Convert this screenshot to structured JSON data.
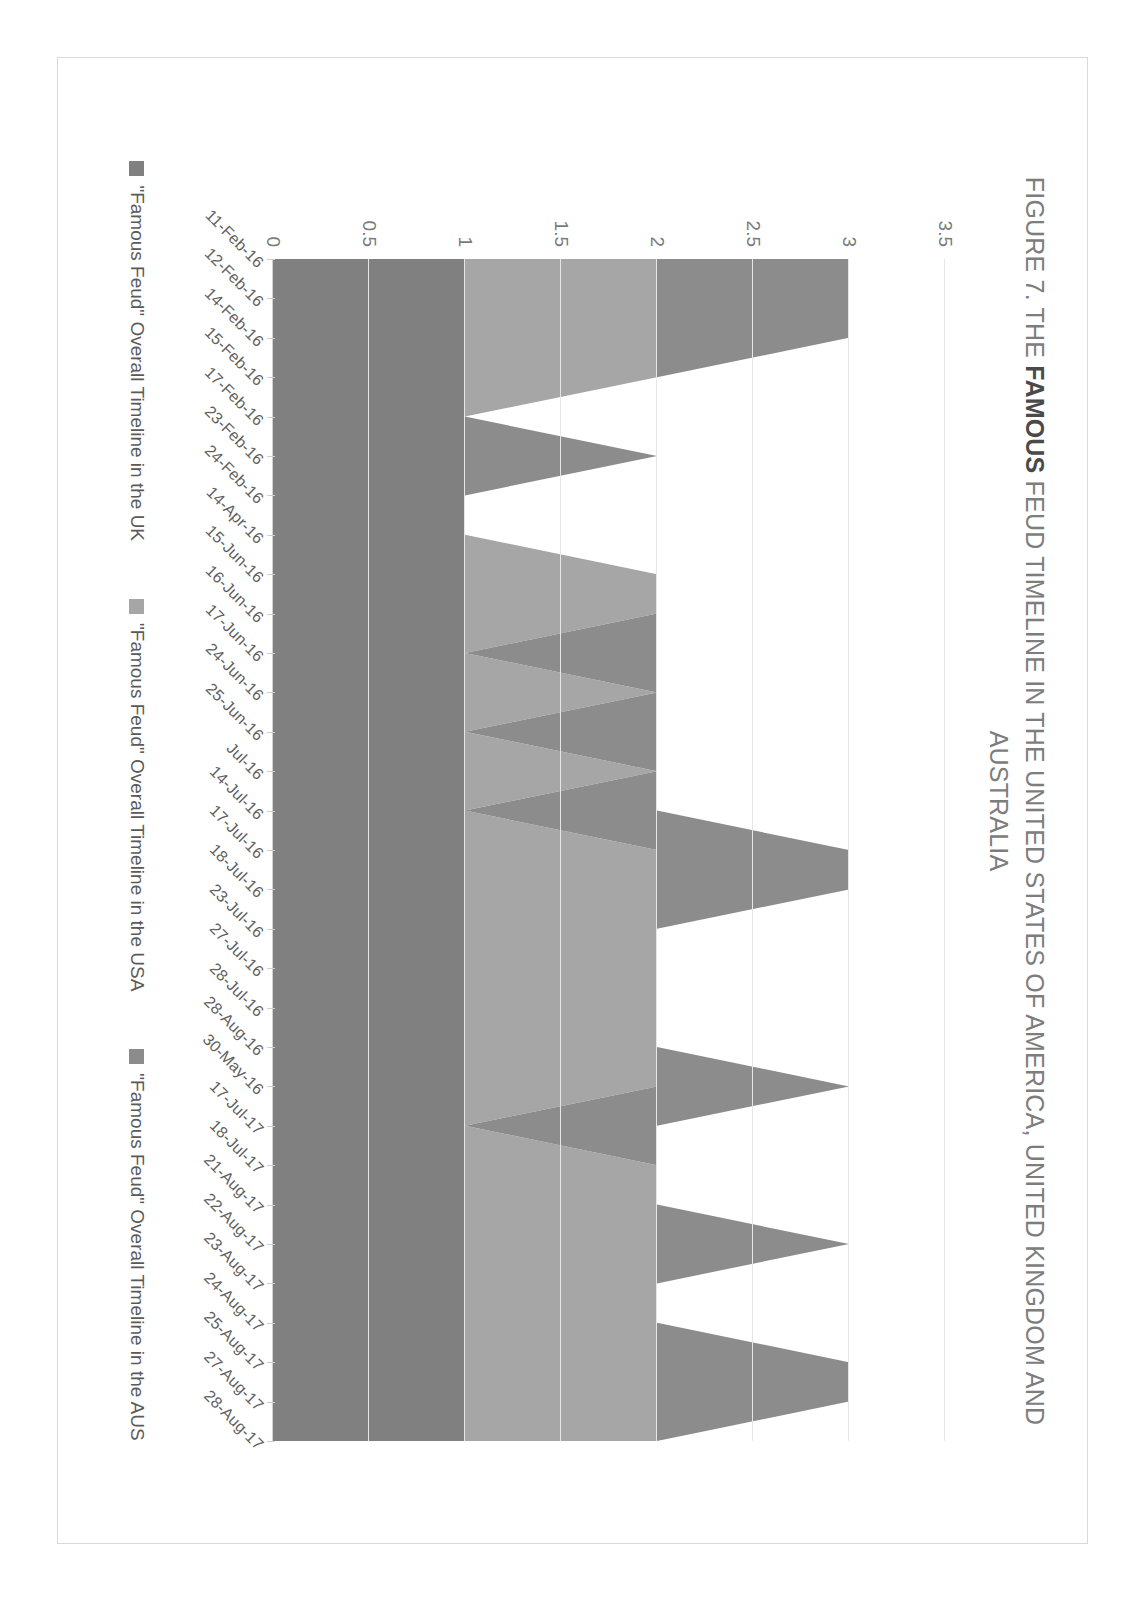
{
  "figure": {
    "title_prefix": "FIGURE 7. THE ",
    "title_bold": "FAMOUS",
    "title_suffix": " FEUD TIMELINE IN THE UNITED STATES OF AMERICA, UNITED KINGDOM AND AUSTRALIA"
  },
  "legend": {
    "items": [
      {
        "label": "\"Famous Feud\" Overall Timeline in the UK",
        "color": "#808080"
      },
      {
        "label": "\"Famous Feud\" Overall Timeline in the USA",
        "color": "#a6a6a6"
      },
      {
        "label": "\"Famous Feud\" Overall Timeline in the AUS",
        "color": "#8c8c8c"
      }
    ]
  },
  "chart_data": {
    "type": "area",
    "stacked": true,
    "orientation": "rotated-90",
    "title": "FIGURE 7. THE FAMOUS FEUD TIMELINE IN THE UNITED STATES OF AMERICA, UNITED KINGDOM AND AUSTRALIA",
    "xlabel": "",
    "ylabel": "",
    "ylim": [
      0,
      3.5
    ],
    "yticks": [
      0,
      0.5,
      1,
      1.5,
      2,
      2.5,
      3,
      3.5
    ],
    "ytick_labels": [
      "0",
      "0.5",
      "1",
      "1.5",
      "2",
      "2.5",
      "3",
      "3.5"
    ],
    "grid": true,
    "legend_position": "bottom",
    "categories": [
      "11-Feb-16",
      "12-Feb-16",
      "14-Feb-16",
      "15-Feb-16",
      "17-Feb-16",
      "23-Feb-16",
      "24-Feb-16",
      "14-Apr-16",
      "15-Jun-16",
      "16-Jun-16",
      "17-Jun-16",
      "24-Jun-16",
      "25-Jun-16",
      "Jul-16",
      "14-Jul-16",
      "17-Jul-16",
      "18-Jul-16",
      "23-Jul-16",
      "27-Jul-16",
      "28-Jul-16",
      "28-Aug-16",
      "30-May-16",
      "17-Jul-17",
      "18-Jul-17",
      "21-Aug-17",
      "22-Aug-17",
      "23-Aug-17",
      "24-Aug-17",
      "25-Aug-17",
      "27-Aug-17",
      "28-Aug-17"
    ],
    "series": [
      {
        "name": "\"Famous Feud\" Overall Timeline in the UK",
        "color": "#808080",
        "values": [
          1,
          1,
          1,
          1,
          1,
          1,
          1,
          1,
          1,
          1,
          1,
          1,
          1,
          1,
          1,
          1,
          1,
          1,
          1,
          1,
          1,
          1,
          1,
          1,
          1,
          1,
          1,
          1,
          1,
          1,
          1
        ]
      },
      {
        "name": "\"Famous Feud\" Overall Timeline in the USA",
        "color": "#a6a6a6",
        "values": [
          1,
          1,
          1,
          1,
          0,
          0,
          0,
          0,
          1,
          1,
          0,
          1,
          0,
          1,
          0,
          1,
          1,
          1,
          1,
          1,
          1,
          1,
          0,
          1,
          1,
          1,
          1,
          1,
          1,
          1,
          1
        ]
      },
      {
        "name": "\"Famous Feud\" Overall Timeline in the AUS",
        "color": "#8c8c8c",
        "values": [
          1,
          1,
          1,
          0,
          0,
          1,
          0,
          0,
          0,
          0,
          1,
          0,
          1,
          0,
          1,
          1,
          1,
          0,
          0,
          0,
          0,
          1,
          1,
          0,
          0,
          1,
          0,
          0,
          1,
          1,
          0
        ]
      }
    ],
    "colors": {
      "uk": "#808080",
      "usa": "#a6a6a6",
      "aus": "#8c8c8c",
      "grid": "#e6e6e6",
      "text": "#7d7d7d"
    }
  }
}
